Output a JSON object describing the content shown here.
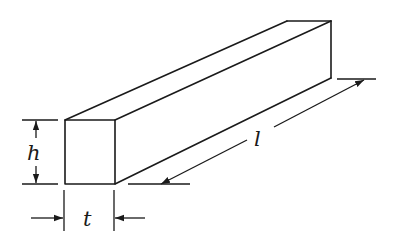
{
  "diagram": {
    "labels": {
      "height": "h",
      "thickness": "t",
      "length": "l"
    },
    "colors": {
      "line": "#1a1a1a",
      "background": "#ffffff"
    }
  }
}
